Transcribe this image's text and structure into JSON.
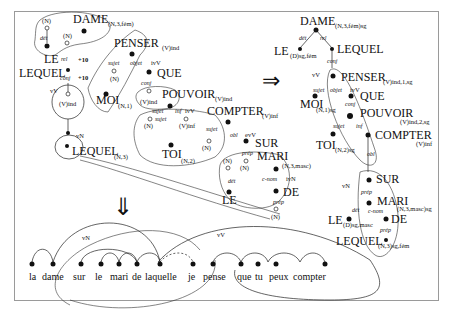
{
  "figure": {
    "type": "dependency-graph transformation diagram",
    "left_graph": {
      "nodes": [
        {
          "word": "DAME",
          "feat": "(N,3,fém)"
        },
        {
          "word": "LE",
          "feat": ""
        },
        {
          "word": "LEQUEL",
          "feat": ""
        },
        {
          "word": "PENSER",
          "feat": "(V)ind"
        },
        {
          "word": "QUE",
          "feat": ""
        },
        {
          "word": "MOI",
          "feat": "(N,1)"
        },
        {
          "word": "POUVOIR",
          "feat": "(V)ind"
        },
        {
          "word": "COMPTER",
          "feat": "(V)inf"
        },
        {
          "word": "TOI",
          "feat": "(N,2)"
        },
        {
          "word": "SUR",
          "feat": ""
        },
        {
          "word": "MARI",
          "feat": "(N,3,masc)"
        },
        {
          "word": "DE",
          "feat": ""
        },
        {
          "word": "LE",
          "feat": ""
        },
        {
          "word": "LEQUEL",
          "feat": "(N,3)"
        }
      ],
      "placeholders": [
        "(N)",
        "(N)",
        "(V)ind",
        "(N)",
        "(V)ind",
        "(N)",
        "(V)inf",
        "(N)",
        "(N)",
        "(N)",
        "(N)",
        "(N)"
      ],
      "relations": [
        "dét",
        "rel",
        "conj",
        "sujet",
        "objet",
        "ivV",
        "conj",
        "sujet",
        "inf",
        "ivV",
        "sujet",
        "sujet",
        "obl",
        "evV",
        "prép",
        "dét",
        "c-nom",
        "ivN",
        "prép"
      ],
      "weights": [
        "+10",
        "+10"
      ],
      "markers": [
        "vV",
        "vN"
      ]
    },
    "right_graph": {
      "nodes": [
        {
          "word": "DAME",
          "feat": "(N,3,fém)sg"
        },
        {
          "word": "LE",
          "feat": "(D)sg,fém"
        },
        {
          "word": "LEQUEL",
          "feat": ""
        },
        {
          "word": "PENSER",
          "feat": "(V)ind,1,sg"
        },
        {
          "word": "QUE",
          "feat": ""
        },
        {
          "word": "MOI",
          "feat": "(N,1)sg"
        },
        {
          "word": "POUVOIR",
          "feat": "(V)ind,2,sg"
        },
        {
          "word": "TOI",
          "feat": "(N,2)sg"
        },
        {
          "word": "COMPTER",
          "feat": "(V)inf"
        },
        {
          "word": "SUR",
          "feat": ""
        },
        {
          "word": "MARI",
          "feat": "(N,3,masc)sg"
        },
        {
          "word": "LE",
          "feat": "(D)sg,masc"
        },
        {
          "word": "DE",
          "feat": ""
        },
        {
          "word": "LEQUEL",
          "feat": "(N,3)sg,fém"
        }
      ],
      "relations": [
        "dét",
        "rel",
        "conj",
        "sujet",
        "objet",
        "ivV",
        "conj",
        "sujet",
        "inf",
        "sujet",
        "obl",
        "prép",
        "dét",
        "c-nom",
        "prép"
      ],
      "markers": [
        "vV",
        "vN"
      ]
    },
    "arrows": {
      "right": "⇒",
      "down": "⇓"
    },
    "sentence": {
      "words": [
        "la",
        "dame",
        "sur",
        "le",
        "mari",
        "de",
        "laquelle",
        "je",
        "pense",
        "que",
        "tu",
        "peux",
        "compter"
      ],
      "markers": [
        "vN",
        "vV"
      ]
    }
  }
}
